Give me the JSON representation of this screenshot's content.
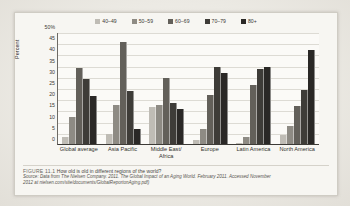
{
  "figure": {
    "caption_label": "FIGURE 11.1",
    "caption_text": "How old is old in different regions of the world?",
    "source_line_1": "Source: Data from The Nielsen Company. 2011. The Global Impact of an Aging World. February 2011. Accessed November",
    "source_line_2": "2012 at nielsen.com/site/documents/GlobalReportonAging.pdf)"
  },
  "chart_data": {
    "type": "bar",
    "title": "How old is old in different regions of the world?",
    "xlabel": "",
    "ylabel": "Percent",
    "ylim": [
      0,
      50
    ],
    "ytick_labels": [
      "50%",
      "45",
      "40",
      "35",
      "30",
      "25",
      "20",
      "15",
      "10",
      "5",
      "0"
    ],
    "ytick_values": [
      50,
      45,
      40,
      35,
      30,
      25,
      20,
      15,
      10,
      5,
      0
    ],
    "grid": true,
    "legend_position": "top",
    "categories": [
      "Global average",
      "Asia Pacific",
      "Middle East/ Africa",
      "Europe",
      "Latin America",
      "North America"
    ],
    "series": [
      {
        "name": "40–49",
        "color": "#bfbcb5",
        "values": [
          3,
          4.5,
          16.5,
          2,
          0.5,
          4
        ]
      },
      {
        "name": "50–59",
        "color": "#8e8b84",
        "values": [
          12,
          17.5,
          17.5,
          6.5,
          3,
          8
        ]
      },
      {
        "name": "60–69",
        "color": "#63605a",
        "values": [
          34,
          45.5,
          29.5,
          22,
          26.5,
          17
        ]
      },
      {
        "name": "70–79",
        "color": "#3e3c38",
        "values": [
          29,
          23.5,
          18.5,
          34.5,
          33.5,
          24
        ]
      },
      {
        "name": "80+",
        "color": "#2a2826",
        "values": [
          21.5,
          6.5,
          15.5,
          31.5,
          34.5,
          42
        ]
      }
    ]
  }
}
